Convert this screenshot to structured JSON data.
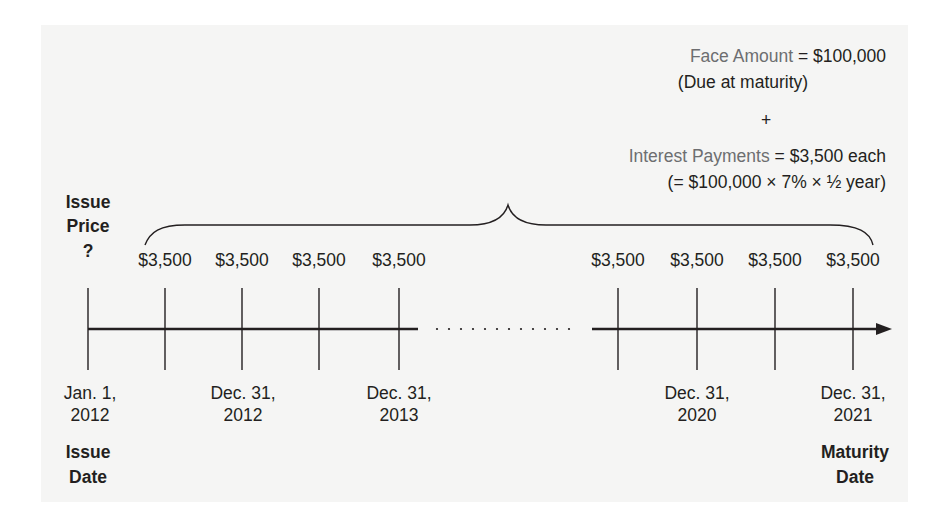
{
  "face": {
    "label": "Face Amount",
    "value": "= $100,000",
    "note": "(Due at maturity)"
  },
  "plus": "+",
  "interest": {
    "label": "Interest Payments",
    "value": "= $3,500 each",
    "formula": "(= $100,000 × 7% × ½ year)"
  },
  "issue_price": {
    "line1": "Issue",
    "line2": "Price",
    "line3": "?"
  },
  "payments": [
    "$3,500",
    "$3,500",
    "$3,500",
    "$3,500",
    "$3,500",
    "$3,500",
    "$3,500",
    "$3,500"
  ],
  "dates": [
    {
      "line1": "Jan. 1,",
      "line2": "2012"
    },
    {
      "line1": "Dec. 31,",
      "line2": "2012"
    },
    {
      "line1": "Dec. 31,",
      "line2": "2013"
    },
    {
      "line1": "Dec. 31,",
      "line2": "2020"
    },
    {
      "line1": "Dec. 31,",
      "line2": "2021"
    }
  ],
  "issue_date": {
    "line1": "Issue",
    "line2": "Date"
  },
  "maturity_date": {
    "line1": "Maturity",
    "line2": "Date"
  },
  "colors": {
    "panel": "#f5f5f4",
    "label_gray": "#6d6e70",
    "ink": "#231f20"
  }
}
